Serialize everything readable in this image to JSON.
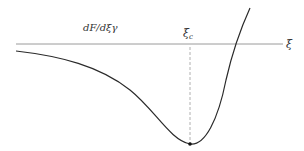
{
  "diagram": {
    "curve_label": "dF/dξγ",
    "critical_label_base": "ξ",
    "critical_label_sub": "c",
    "axis_label": "ξ",
    "colors": {
      "axis": "#9a9a9a",
      "curve": "#2a2a2a",
      "dashed": "#b0b0b0",
      "point": "#111111"
    }
  }
}
